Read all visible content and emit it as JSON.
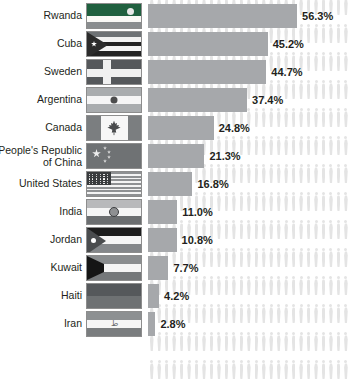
{
  "chart_data": {
    "type": "bar",
    "title": "",
    "xlabel": "",
    "ylabel": "",
    "orientation": "horizontal",
    "grid": false,
    "legend": false,
    "xlim": [
      0,
      56.3
    ],
    "value_suffix": "%",
    "categories": [
      "Rwanda",
      "Cuba",
      "Sweden",
      "Argentina",
      "Canada",
      "People's Republic\nof China",
      "United States",
      "India",
      "Jordan",
      "Kuwait",
      "Haiti",
      "Iran"
    ],
    "values": [
      56.3,
      45.2,
      44.7,
      37.4,
      24.8,
      21.3,
      16.8,
      11.0,
      10.8,
      7.7,
      4.2,
      2.8
    ],
    "value_labels": [
      "56.3%",
      "45.2%",
      "44.7%",
      "37.4%",
      "24.8%",
      "21.3%",
      "16.8%",
      "11.0%",
      "10.8%",
      "7.7%",
      "4.2%",
      "2.8%"
    ],
    "bar_color": "#a6a8ab",
    "background_pictogram": "person-icon",
    "pictogram_color": "#e4e4e4",
    "label_color": "#231f20"
  },
  "rows": [
    {
      "country": "Rwanda",
      "flag": "rwanda-flag",
      "value_label": "56.3%",
      "value": 56.3
    },
    {
      "country": "Cuba",
      "flag": "cuba-flag",
      "value_label": "45.2%",
      "value": 45.2
    },
    {
      "country": "Sweden",
      "flag": "sweden-flag",
      "value_label": "44.7%",
      "value": 44.7
    },
    {
      "country": "Argentina",
      "flag": "argentina-flag",
      "value_label": "37.4%",
      "value": 37.4
    },
    {
      "country": "Canada",
      "flag": "canada-flag",
      "value_label": "24.8%",
      "value": 24.8
    },
    {
      "country": "People's Republic\nof China",
      "flag": "china-flag",
      "value_label": "21.3%",
      "value": 21.3
    },
    {
      "country": "United States",
      "flag": "usa-flag",
      "value_label": "16.8%",
      "value": 16.8
    },
    {
      "country": "India",
      "flag": "india-flag",
      "value_label": "11.0%",
      "value": 11.0
    },
    {
      "country": "Jordan",
      "flag": "jordan-flag",
      "value_label": "10.8%",
      "value": 10.8
    },
    {
      "country": "Kuwait",
      "flag": "kuwait-flag",
      "value_label": "7.7%",
      "value": 7.7
    },
    {
      "country": "Haiti",
      "flag": "haiti-flag",
      "value_label": "4.2%",
      "value": 4.2
    },
    {
      "country": "Iran",
      "flag": "iran-flag",
      "value_label": "2.8%",
      "value": 2.8
    }
  ],
  "iran_emblem_glyph": "ط"
}
